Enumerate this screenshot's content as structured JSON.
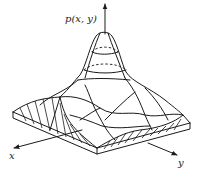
{
  "figure": {
    "type": "3d-surface-plot",
    "z_axis_label": "p(x, y)",
    "x_axis_label": "x",
    "y_axis_label": "y",
    "colors": {
      "stroke": "#1a1a1a",
      "background": "#ffffff"
    }
  }
}
